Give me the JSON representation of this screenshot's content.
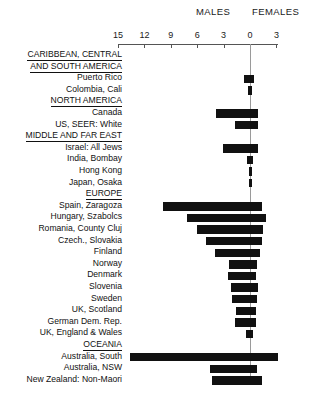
{
  "header": {
    "males_label": "MALES",
    "females_label": "FEMALES"
  },
  "axis": {
    "ticks": [
      15,
      12,
      9,
      6,
      3,
      0,
      3
    ],
    "tick_labels": [
      "15",
      "12",
      "9",
      "6",
      "3",
      "0",
      "3"
    ],
    "zero_label": "0",
    "left_max": 15,
    "right_max": 3
  },
  "rows": [
    {
      "label": "CARIBBEAN, CENTRAL",
      "type": "group-top",
      "male": null,
      "female": null
    },
    {
      "label": "AND SOUTH AMERICA",
      "type": "group",
      "male": null,
      "female": null
    },
    {
      "label": "Puerto Rico",
      "type": "data",
      "male": 0.7,
      "female": 0.45
    },
    {
      "label": "Colombia, Cali",
      "type": "data",
      "male": 0.2,
      "female": 0.2
    },
    {
      "label": "NORTH AMERICA",
      "type": "group",
      "male": null,
      "female": null
    },
    {
      "label": "Canada",
      "type": "data",
      "male": 3.9,
      "female": 0.9
    },
    {
      "label": "US, SEER: White",
      "type": "data",
      "male": 1.7,
      "female": 0.9
    },
    {
      "label": "MIDDLE AND FAR EAST",
      "type": "group",
      "male": null,
      "female": null
    },
    {
      "label": "Israel: All Jews",
      "type": "data",
      "male": 3.1,
      "female": 0.9
    },
    {
      "label": "India, Bombay",
      "type": "data",
      "male": 0.3,
      "female": 0.35
    },
    {
      "label": "Hong Kong",
      "type": "data",
      "male": 0.15,
      "female": 0.1
    },
    {
      "label": "Japan, Osaka",
      "type": "data",
      "male": 0.1,
      "female": 0.05
    },
    {
      "label": "EUROPE",
      "type": "group",
      "male": null,
      "female": null
    },
    {
      "label": "Spain, Zaragoza",
      "type": "data",
      "male": 9.9,
      "female": 1.4
    },
    {
      "label": "Hungary, Szabolcs",
      "type": "data",
      "male": 7.2,
      "female": 1.8
    },
    {
      "label": "Romania, County Cluj",
      "type": "data",
      "male": 6.0,
      "female": 1.5
    },
    {
      "label": "Czech., Slovakia",
      "type": "data",
      "male": 5.0,
      "female": 1.4
    },
    {
      "label": "Finland",
      "type": "data",
      "male": 4.0,
      "female": 1.1
    },
    {
      "label": "Norway",
      "type": "data",
      "male": 2.4,
      "female": 0.8
    },
    {
      "label": "Denmark",
      "type": "data",
      "male": 2.5,
      "female": 0.7
    },
    {
      "label": "Slovenia",
      "type": "data",
      "male": 2.2,
      "female": 0.9
    },
    {
      "label": "Sweden",
      "type": "data",
      "male": 2.1,
      "female": 0.8
    },
    {
      "label": "UK, Scotland",
      "type": "data",
      "male": 1.6,
      "female": 0.7
    },
    {
      "label": "German Dem. Rep.",
      "type": "data",
      "male": 1.7,
      "female": 0.7
    },
    {
      "label": "UK, England & Wales",
      "type": "data",
      "male": 0.5,
      "female": 0.35
    },
    {
      "label": "OCEANIA",
      "type": "group",
      "male": null,
      "female": null
    },
    {
      "label": "Australia, South",
      "type": "data",
      "male": 13.6,
      "female": 3.2
    },
    {
      "label": "Australia, NSW",
      "type": "data",
      "male": 4.5,
      "female": 0.8
    },
    {
      "label": "New Zealand: Non-Maori",
      "type": "data",
      "male": 4.3,
      "female": 1.4
    }
  ],
  "chart_data": {
    "type": "bar",
    "orientation": "horizontal",
    "title": "",
    "xlabel": "",
    "ylabel": "",
    "xlim": [
      -15,
      3
    ],
    "grid": false,
    "legend": [
      "MALES",
      "FEMALES"
    ],
    "legend_position": "top",
    "axis_ticks": [
      15,
      12,
      9,
      6,
      3,
      0,
      3
    ],
    "note": "Bars extend left of zero for MALES and right of zero for FEMALES.",
    "categories": [
      "Puerto Rico",
      "Colombia, Cali",
      "Canada",
      "US, SEER: White",
      "Israel: All Jews",
      "India, Bombay",
      "Hong Kong",
      "Japan, Osaka",
      "Spain, Zaragoza",
      "Hungary, Szabolcs",
      "Romania, County Cluj",
      "Czech., Slovakia",
      "Finland",
      "Norway",
      "Denmark",
      "Slovenia",
      "Sweden",
      "UK, Scotland",
      "German Dem. Rep.",
      "UK, England & Wales",
      "Australia, South",
      "Australia, NSW",
      "New Zealand: Non-Maori"
    ],
    "series": [
      {
        "name": "MALES",
        "values": [
          0.7,
          0.2,
          3.9,
          1.7,
          3.1,
          0.3,
          0.15,
          0.1,
          9.9,
          7.2,
          6.0,
          5.0,
          4.0,
          2.4,
          2.5,
          2.2,
          2.1,
          1.6,
          1.7,
          0.5,
          13.6,
          4.5,
          4.3
        ]
      },
      {
        "name": "FEMALES",
        "values": [
          0.45,
          0.2,
          0.9,
          0.9,
          0.9,
          0.35,
          0.1,
          0.05,
          1.4,
          1.8,
          1.5,
          1.4,
          1.1,
          0.8,
          0.7,
          0.9,
          0.8,
          0.7,
          0.7,
          0.35,
          3.2,
          0.8,
          1.4
        ]
      }
    ],
    "groups": [
      "CARIBBEAN, CENTRAL AND SOUTH AMERICA",
      "NORTH AMERICA",
      "MIDDLE AND FAR EAST",
      "EUROPE",
      "OCEANIA"
    ]
  },
  "colors": {
    "bar": "#111111",
    "axis": "#555555",
    "zero_line": "#9a9a9a",
    "text": "#111111",
    "background": "#ffffff"
  }
}
